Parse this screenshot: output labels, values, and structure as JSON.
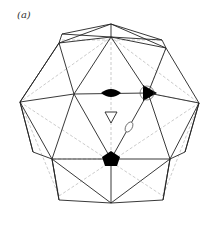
{
  "panel_label": "(a)",
  "figure": {
    "colors": {
      "edge": "#222222",
      "hidden_edge": "#b0b0b0",
      "fill": "#000000"
    },
    "symbols": [
      {
        "name": "two-fold-axis",
        "shape": "lens",
        "filled": true
      },
      {
        "name": "three-fold-axis",
        "shape": "triangle",
        "filled": true
      },
      {
        "name": "five-fold-axis",
        "shape": "pentagon",
        "filled": true
      },
      {
        "name": "three-fold-axis-open",
        "shape": "triangle",
        "filled": false
      },
      {
        "name": "two-fold-axis-open",
        "shape": "lens",
        "filled": false
      }
    ]
  }
}
